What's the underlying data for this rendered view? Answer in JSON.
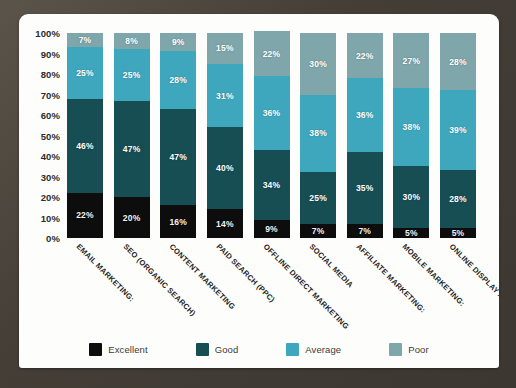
{
  "frame": {
    "color": "#4a443d"
  },
  "card": {
    "background": "#fdfdfb"
  },
  "legend": {
    "items": [
      {
        "label": "Excellent",
        "color": "#0d0d0d",
        "swatch_name": "legend-swatch-excellent"
      },
      {
        "label": "Good",
        "color": "#164e54",
        "swatch_name": "legend-swatch-good"
      },
      {
        "label": "Average",
        "color": "#3fa7bd",
        "swatch_name": "legend-swatch-average"
      },
      {
        "label": "Poor",
        "color": "#7ea6ab",
        "swatch_name": "legend-swatch-poor"
      }
    ]
  },
  "chart_data": {
    "type": "bar",
    "title": "",
    "subtitle": "",
    "xlabel": "",
    "ylabel": "",
    "stacked": true,
    "orientation": "vertical",
    "grid": false,
    "legend_position": "bottom",
    "ylim": [
      0,
      100
    ],
    "ytick_labels": [
      "100%",
      "90%",
      "80%",
      "70%",
      "60%",
      "50%",
      "40%",
      "30%",
      "20%",
      "10%",
      "0%"
    ],
    "ytick_values": [
      100,
      90,
      80,
      70,
      60,
      50,
      40,
      30,
      20,
      10,
      0
    ],
    "categories": [
      "EMAIL MARKETING:",
      "SEO (ORGANIC SEARCH)",
      "CONTENT MARKETING",
      "PAID SEARCH (PPC)",
      "OFFLINE DIRECT MARKETING",
      "SOCIAL MEDIA",
      "AFFILIATE MARKETING:",
      "MOBILE MARKETING:",
      "ONLINE DISPLAY ADVERTISING"
    ],
    "series": [
      {
        "name": "Excellent",
        "color": "#0d0d0d",
        "values": [
          22,
          20,
          16,
          14,
          9,
          7,
          7,
          5,
          5
        ],
        "labels": [
          "22%",
          "20%",
          "16%",
          "14%",
          "9%",
          "7%",
          "7%",
          "5%",
          "5%"
        ]
      },
      {
        "name": "Good",
        "color": "#164e54",
        "values": [
          46,
          47,
          47,
          40,
          34,
          25,
          35,
          30,
          28
        ],
        "labels": [
          "46%",
          "47%",
          "47%",
          "40%",
          "34%",
          "25%",
          "35%",
          "30%",
          "28%"
        ]
      },
      {
        "name": "Average",
        "color": "#3fa7bd",
        "values": [
          25,
          25,
          28,
          31,
          36,
          38,
          36,
          38,
          39
        ],
        "labels": [
          "25%",
          "25%",
          "28%",
          "31%",
          "36%",
          "38%",
          "36%",
          "38%",
          "39%"
        ]
      },
      {
        "name": "Poor",
        "color": "#7ea6ab",
        "values": [
          7,
          8,
          9,
          15,
          22,
          30,
          22,
          27,
          28
        ],
        "labels": [
          "7%",
          "8%",
          "9%",
          "15%",
          "22%",
          "30%",
          "22%",
          "27%",
          "28%"
        ]
      }
    ]
  }
}
